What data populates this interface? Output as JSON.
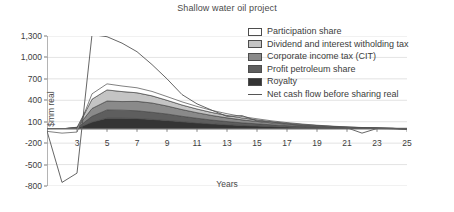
{
  "chart_data": {
    "type": "area",
    "title": "Shallow water oil project",
    "xlabel": "Years",
    "ylabel": "$mm real",
    "xlim": [
      1,
      25
    ],
    "ylim": [
      -800,
      1300
    ],
    "grid": true,
    "legend_position": "top-right",
    "stacked": true,
    "x": [
      1,
      2,
      3,
      4,
      5,
      6,
      7,
      8,
      9,
      10,
      11,
      12,
      13,
      14,
      15,
      16,
      17,
      18,
      19,
      20,
      21,
      22,
      23,
      24,
      25
    ],
    "xticks": [
      "3",
      "5",
      "7",
      "9",
      "11",
      "13",
      "15",
      "17",
      "19",
      "21",
      "23",
      "25"
    ],
    "xtick_values": [
      3,
      5,
      7,
      9,
      11,
      13,
      15,
      17,
      19,
      21,
      23,
      25
    ],
    "yticks": [
      "1,300",
      "1,000",
      "700",
      "400",
      "100",
      "-200",
      "-500",
      "-800"
    ],
    "ytick_values": [
      1300,
      1000,
      700,
      400,
      100,
      -200,
      -500,
      -800
    ],
    "series": [
      {
        "name": "Royalty",
        "color": "#343434",
        "type": "area-stacked",
        "order": 1,
        "values": [
          0,
          0,
          8,
          95,
          150,
          150,
          145,
          132,
          118,
          100,
          84,
          70,
          58,
          48,
          40,
          32,
          26,
          20,
          15,
          11,
          8,
          6,
          4,
          2,
          0
        ]
      },
      {
        "name": "Profit petroleum share",
        "color": "#5e5e5e",
        "type": "area-stacked",
        "order": 2,
        "values": [
          0,
          0,
          6,
          80,
          115,
          112,
          108,
          100,
          90,
          76,
          64,
          53,
          44,
          36,
          30,
          24,
          19,
          15,
          11,
          8,
          6,
          4,
          3,
          2,
          0
        ]
      },
      {
        "name": "Corporate income tax (CIT)",
        "color": "#8a8a8a",
        "type": "area-stacked",
        "order": 3,
        "values": [
          0,
          0,
          5,
          110,
          125,
          120,
          132,
          130,
          112,
          94,
          78,
          64,
          52,
          42,
          34,
          27,
          21,
          16,
          12,
          9,
          6,
          4,
          3,
          2,
          0
        ]
      },
      {
        "name": "Dividend and interest witholding tax",
        "color": "#c4c4c4",
        "type": "area-stacked",
        "order": 4,
        "values": [
          0,
          0,
          4,
          130,
          155,
          140,
          120,
          100,
          80,
          64,
          52,
          42,
          34,
          27,
          22,
          17,
          13,
          10,
          8,
          6,
          4,
          3,
          2,
          1,
          0
        ]
      },
      {
        "name": "Participation share",
        "color": "#ffffff",
        "type": "area-stacked",
        "order": 5,
        "values": [
          -35,
          -60,
          -45,
          75,
          85,
          78,
          70,
          62,
          52,
          44,
          36,
          29,
          24,
          19,
          15,
          12,
          9,
          7,
          5,
          4,
          3,
          2,
          1,
          1,
          0
        ]
      },
      {
        "name": "Net cash flow before sharing real",
        "color": "#555555",
        "type": "line",
        "values": [
          -30,
          -750,
          -620,
          1320,
          1290,
          1200,
          1080,
          900,
          700,
          480,
          350,
          260,
          175,
          185,
          110,
          95,
          70,
          45,
          30,
          22,
          15,
          -60,
          5,
          8,
          8
        ]
      }
    ]
  },
  "legend": {
    "items": [
      {
        "label": "Participation share",
        "swatch": "#ffffff",
        "kind": "swatch"
      },
      {
        "label": "Dividend and interest witholding tax",
        "swatch": "#c4c4c4",
        "kind": "swatch"
      },
      {
        "label": "Corporate income tax (CIT)",
        "swatch": "#8a8a8a",
        "kind": "swatch"
      },
      {
        "label": "Profit petroleum share",
        "swatch": "#5e5e5e",
        "kind": "swatch"
      },
      {
        "label": "Royalty",
        "swatch": "#343434",
        "kind": "swatch"
      },
      {
        "label": "Net cash flow before sharing real",
        "swatch": "#555555",
        "kind": "line"
      }
    ]
  }
}
